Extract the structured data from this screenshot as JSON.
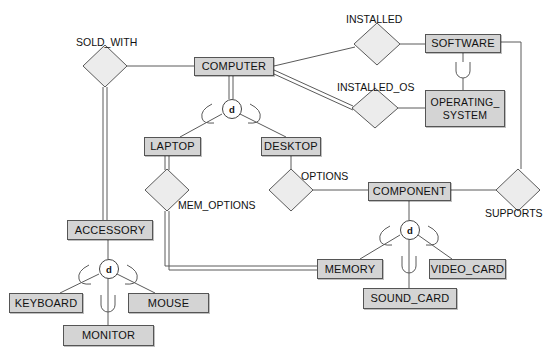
{
  "diagram": {
    "type": "eer-diagram",
    "colors": {
      "entity_fill": "#d4d4d4",
      "entity_stroke": "#555555",
      "relationship_fill": "#ececec",
      "relationship_stroke": "#555555",
      "line": "#555555",
      "background": "#ffffff"
    },
    "entities": [
      {
        "id": "computer",
        "label": "COMPUTER",
        "x": 194,
        "y": 57,
        "w": 80,
        "h": 19
      },
      {
        "id": "software",
        "label": "SOFTWARE",
        "x": 425,
        "y": 34,
        "w": 76,
        "h": 19
      },
      {
        "id": "operating_system",
        "label": "OPERATING_\nSYSTEM",
        "x": 425,
        "y": 90,
        "w": 80,
        "h": 37
      },
      {
        "id": "laptop",
        "label": "LAPTOP",
        "x": 144,
        "y": 137,
        "w": 57,
        "h": 19
      },
      {
        "id": "desktop",
        "label": "DESKTOP",
        "x": 261,
        "y": 137,
        "w": 60,
        "h": 19
      },
      {
        "id": "component",
        "label": "COMPONENT",
        "x": 368,
        "y": 182,
        "w": 83,
        "h": 19
      },
      {
        "id": "accessory",
        "label": "ACCESSORY",
        "x": 67,
        "y": 220,
        "w": 86,
        "h": 20
      },
      {
        "id": "memory",
        "label": "MEMORY",
        "x": 317,
        "y": 259,
        "w": 66,
        "h": 20
      },
      {
        "id": "video_card",
        "label": "VIDEO_CARD",
        "x": 429,
        "y": 259,
        "w": 77,
        "h": 20
      },
      {
        "id": "sound_card",
        "label": "SOUND_CARD",
        "x": 363,
        "y": 288,
        "w": 94,
        "h": 21
      },
      {
        "id": "keyboard",
        "label": "KEYBOARD",
        "x": 9,
        "y": 293,
        "w": 74,
        "h": 20
      },
      {
        "id": "mouse",
        "label": "MOUSE",
        "x": 128,
        "y": 293,
        "w": 81,
        "h": 20
      },
      {
        "id": "monitor",
        "label": "MONITOR",
        "x": 63,
        "y": 325,
        "w": 91,
        "h": 21
      }
    ],
    "relationships": [
      {
        "id": "sold_with",
        "label": "SOLD_WITH",
        "cx": 105,
        "cy": 66,
        "rx": 22,
        "ry": 21,
        "label_x": 76,
        "label_y": 36
      },
      {
        "id": "installed",
        "label": "INSTALLED",
        "cx": 377,
        "cy": 44,
        "rx": 23,
        "ry": 21,
        "label_x": 346,
        "label_y": 13
      },
      {
        "id": "installed_os",
        "label": "INSTALLED_OS",
        "cx": 375,
        "cy": 108,
        "rx": 23,
        "ry": 20,
        "label_x": 337,
        "label_y": 81
      },
      {
        "id": "mem_options",
        "label": "MEM_OPTIONS",
        "cx": 167,
        "cy": 190,
        "rx": 22,
        "ry": 21,
        "label_x": 178,
        "label_y": 199
      },
      {
        "id": "options",
        "label": "OPTIONS",
        "cx": 291,
        "cy": 190,
        "rx": 22,
        "ry": 21,
        "label_x": 301,
        "label_y": 170
      },
      {
        "id": "supports",
        "label": "SUPPORTS",
        "cx": 518,
        "cy": 190,
        "rx": 22,
        "ry": 21,
        "label_x": 485,
        "label_y": 207
      }
    ],
    "specializations": [
      {
        "id": "computer-spec",
        "symbol": "d",
        "cx": 231,
        "cy": 108,
        "parent": "computer",
        "children": [
          "laptop",
          "desktop"
        ],
        "total": true
      },
      {
        "id": "accessory-spec",
        "symbol": "d",
        "cx": 108,
        "cy": 268,
        "parent": "accessory",
        "children": [
          "keyboard",
          "mouse",
          "monitor"
        ],
        "total": false
      },
      {
        "id": "component-spec",
        "symbol": "d",
        "cx": 409,
        "cy": 229,
        "parent": "component",
        "children": [
          "memory",
          "video_card",
          "sound_card"
        ],
        "total": false
      }
    ],
    "subset_symbols": [
      {
        "id": "software-os-subset",
        "x": 463,
        "y": 62,
        "h": 16
      }
    ],
    "connections": [
      {
        "from": "sold_with",
        "to": "computer",
        "style": "single"
      },
      {
        "from": "sold_with",
        "to": "accessory",
        "style": "double"
      },
      {
        "from": "computer",
        "to": "installed",
        "style": "single"
      },
      {
        "from": "installed",
        "to": "software",
        "style": "single"
      },
      {
        "from": "computer",
        "to": "installed_os",
        "style": "double"
      },
      {
        "from": "installed_os",
        "to": "operating_system",
        "style": "single"
      },
      {
        "from": "software",
        "to": "operating_system",
        "style": "subset"
      },
      {
        "from": "laptop",
        "to": "mem_options",
        "style": "double"
      },
      {
        "from": "mem_options",
        "to": "memory",
        "style": "double"
      },
      {
        "from": "desktop",
        "to": "options",
        "style": "single"
      },
      {
        "from": "options",
        "to": "component",
        "style": "single"
      },
      {
        "from": "component",
        "to": "supports",
        "style": "single"
      },
      {
        "from": "supports",
        "to": "software",
        "style": "single"
      }
    ]
  }
}
